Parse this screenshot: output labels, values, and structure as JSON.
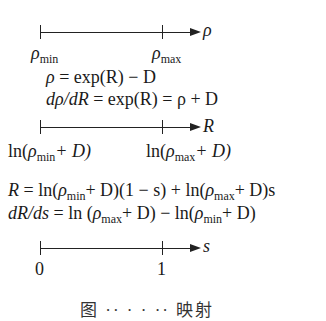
{
  "axes": [
    {
      "variable": "ρ",
      "ticks": [
        {
          "base": "ρ",
          "sub": "min"
        },
        {
          "base": "ρ",
          "sub": "max"
        }
      ]
    },
    {
      "variable": "R",
      "ticks": [
        {
          "pre": "ln(",
          "base": "ρ",
          "sub": "min",
          "post": "+ D)"
        },
        {
          "pre": "ln(",
          "base": "ρ",
          "sub": "max",
          "post": "+ D)"
        }
      ]
    },
    {
      "variable": "s",
      "ticks": [
        {
          "text": "0"
        },
        {
          "text": "1"
        }
      ]
    }
  ],
  "equations": {
    "rho_of_R": {
      "lhs": "ρ",
      "rhs": " = exp(R) − D"
    },
    "drho_dR": {
      "lhs": "dρ/dR",
      "rhs": " = exp(R) = ρ + D"
    },
    "R_of_s": {
      "lhs": "R",
      "p1": " = ln(",
      "rho1": "ρ",
      "sub1": "min",
      "p2": "+ D)(1 − s) + ln(",
      "rho2": "ρ",
      "sub2": "max",
      "p3": "+ D)s"
    },
    "dR_ds": {
      "lhs": "dR/ds",
      "p1": " = ln (",
      "rho1": "ρ",
      "sub1": "max",
      "p2": "+ D) − ln(",
      "rho2": "ρ",
      "sub2": "min",
      "p3": "+ D)"
    }
  },
  "caption": "图 ·· ·  · ·· 映射"
}
